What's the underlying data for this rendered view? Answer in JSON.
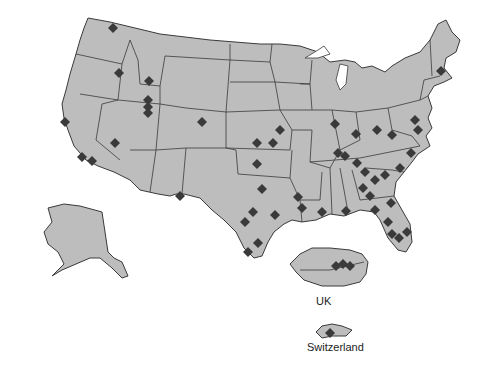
{
  "map": {
    "title": "",
    "regions": [
      "USA (contiguous)",
      "Alaska",
      "UK",
      "Switzerland"
    ],
    "labels": {
      "uk": "UK",
      "switzerland": "Switzerland"
    },
    "colors": {
      "land": "#bdbdbd",
      "border": "#3a3a3a",
      "marker": "#3a3a3a",
      "water": "#ffffff"
    },
    "marker_shape": "diamond",
    "markers": [
      {
        "x": 113,
        "y": 28,
        "region": "Washington"
      },
      {
        "x": 119,
        "y": 73,
        "region": "Idaho"
      },
      {
        "x": 149,
        "y": 81,
        "region": "Idaho"
      },
      {
        "x": 148,
        "y": 100,
        "region": "Utah"
      },
      {
        "x": 148,
        "y": 107,
        "region": "Utah"
      },
      {
        "x": 148,
        "y": 113,
        "region": "Utah"
      },
      {
        "x": 202,
        "y": 122,
        "region": "Colorado"
      },
      {
        "x": 65,
        "y": 122,
        "region": "California"
      },
      {
        "x": 115,
        "y": 143,
        "region": "Nevada"
      },
      {
        "x": 82,
        "y": 157,
        "region": "California"
      },
      {
        "x": 92,
        "y": 161,
        "region": "California"
      },
      {
        "x": 180,
        "y": 196,
        "region": "Texas"
      },
      {
        "x": 280,
        "y": 130,
        "region": "Missouri/Kansas"
      },
      {
        "x": 257,
        "y": 143,
        "region": "Kansas"
      },
      {
        "x": 273,
        "y": 143,
        "region": "Kansas"
      },
      {
        "x": 257,
        "y": 164,
        "region": "Oklahoma"
      },
      {
        "x": 262,
        "y": 189,
        "region": "Texas"
      },
      {
        "x": 253,
        "y": 212,
        "region": "Texas"
      },
      {
        "x": 245,
        "y": 222,
        "region": "Texas"
      },
      {
        "x": 275,
        "y": 215,
        "region": "Texas"
      },
      {
        "x": 258,
        "y": 243,
        "region": "Texas"
      },
      {
        "x": 248,
        "y": 252,
        "region": "Texas"
      },
      {
        "x": 298,
        "y": 197,
        "region": "Louisiana"
      },
      {
        "x": 302,
        "y": 208,
        "region": "Louisiana"
      },
      {
        "x": 322,
        "y": 212,
        "region": "Mississippi/Alabama"
      },
      {
        "x": 335,
        "y": 124,
        "region": "Illinois"
      },
      {
        "x": 356,
        "y": 134,
        "region": "Indiana"
      },
      {
        "x": 345,
        "y": 156,
        "region": "Tennessee"
      },
      {
        "x": 338,
        "y": 153,
        "region": "Tennessee"
      },
      {
        "x": 377,
        "y": 130,
        "region": "Ohio/Kentucky"
      },
      {
        "x": 392,
        "y": 135,
        "region": "West Virginia"
      },
      {
        "x": 415,
        "y": 120,
        "region": "Virginia/Maryland"
      },
      {
        "x": 418,
        "y": 130,
        "region": "Virginia"
      },
      {
        "x": 357,
        "y": 163,
        "region": "Georgia"
      },
      {
        "x": 365,
        "y": 172,
        "region": "Georgia"
      },
      {
        "x": 375,
        "y": 180,
        "region": "Georgia"
      },
      {
        "x": 363,
        "y": 188,
        "region": "Georgia"
      },
      {
        "x": 370,
        "y": 196,
        "region": "Georgia"
      },
      {
        "x": 385,
        "y": 175,
        "region": "South Carolina"
      },
      {
        "x": 400,
        "y": 168,
        "region": "South Carolina"
      },
      {
        "x": 411,
        "y": 153,
        "region": "North Carolina"
      },
      {
        "x": 375,
        "y": 210,
        "region": "Florida"
      },
      {
        "x": 391,
        "y": 203,
        "region": "Florida"
      },
      {
        "x": 388,
        "y": 222,
        "region": "Florida"
      },
      {
        "x": 392,
        "y": 234,
        "region": "Florida"
      },
      {
        "x": 399,
        "y": 238,
        "region": "Florida"
      },
      {
        "x": 407,
        "y": 232,
        "region": "Florida"
      },
      {
        "x": 346,
        "y": 211,
        "region": "Alabama/Florida"
      },
      {
        "x": 441,
        "y": 71,
        "region": "Massachusetts"
      },
      {
        "x": 343,
        "y": 264,
        "region": "UK"
      },
      {
        "x": 350,
        "y": 266,
        "region": "UK"
      },
      {
        "x": 336,
        "y": 266,
        "region": "UK"
      },
      {
        "x": 330,
        "y": 333,
        "region": "Switzerland"
      }
    ]
  }
}
